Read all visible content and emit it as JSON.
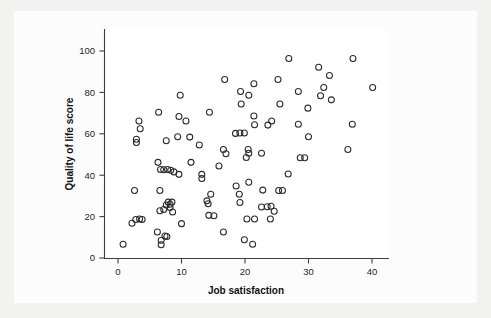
{
  "chart_data": {
    "type": "scatter",
    "title": "",
    "xlabel": "Job satisfaction",
    "ylabel": "Quality of life score",
    "xlim": [
      -1.5,
      42.5
    ],
    "ylim": [
      -4,
      107
    ],
    "xticks": [
      0,
      10,
      20,
      30,
      40
    ],
    "xtick_labels": [
      "0",
      "10",
      "20",
      "30",
      "40"
    ],
    "yticks": [
      0,
      20,
      40,
      60,
      80,
      100
    ],
    "ytick_labels": [
      "0",
      "20",
      "40",
      "60",
      "80",
      "100"
    ],
    "grid": false,
    "legend": null,
    "marker": "open-circle",
    "marker_color": "#2b2b2b",
    "marker_radius": 3.0,
    "n_points": 118,
    "points": [
      [
        0.8,
        6.6
      ],
      [
        2.2,
        16.8
      ],
      [
        2.8,
        18.6
      ],
      [
        3.4,
        18.8
      ],
      [
        3.8,
        18.6
      ],
      [
        2.6,
        32.6
      ],
      [
        2.9,
        57.4
      ],
      [
        2.9,
        55.8
      ],
      [
        3.3,
        66.2
      ],
      [
        3.5,
        62.4
      ],
      [
        6.2,
        12.6
      ],
      [
        6.8,
        8.6
      ],
      [
        6.8,
        6.4
      ],
      [
        7.4,
        10.6
      ],
      [
        7.7,
        10.4
      ],
      [
        6.6,
        22.8
      ],
      [
        7.2,
        23.4
      ],
      [
        7.6,
        25.6
      ],
      [
        7.9,
        27.0
      ],
      [
        8.2,
        26.0
      ],
      [
        8.5,
        27.0
      ],
      [
        8.2,
        24.4
      ],
      [
        8.6,
        22.2
      ],
      [
        6.6,
        32.6
      ],
      [
        6.3,
        46.2
      ],
      [
        6.7,
        42.8
      ],
      [
        7.2,
        42.6
      ],
      [
        7.8,
        42.8
      ],
      [
        8.3,
        42.4
      ],
      [
        8.8,
        41.6
      ],
      [
        9.6,
        40.4
      ],
      [
        6.4,
        70.4
      ],
      [
        7.6,
        56.6
      ],
      [
        9.4,
        58.6
      ],
      [
        9.6,
        68.4
      ],
      [
        9.8,
        78.6
      ],
      [
        10.0,
        16.6
      ],
      [
        10.7,
        66.2
      ],
      [
        11.3,
        58.4
      ],
      [
        11.5,
        46.2
      ],
      [
        12.8,
        54.6
      ],
      [
        13.2,
        40.4
      ],
      [
        13.2,
        38.4
      ],
      [
        14.0,
        27.6
      ],
      [
        14.2,
        26.2
      ],
      [
        14.6,
        30.8
      ],
      [
        14.3,
        20.6
      ],
      [
        15.1,
        20.4
      ],
      [
        14.4,
        70.4
      ],
      [
        15.9,
        44.4
      ],
      [
        16.6,
        12.6
      ],
      [
        16.8,
        86.2
      ],
      [
        16.6,
        52.4
      ],
      [
        17.0,
        50.4
      ],
      [
        18.5,
        60.2
      ],
      [
        19.2,
        60.4
      ],
      [
        19.9,
        60.4
      ],
      [
        18.6,
        34.8
      ],
      [
        19.1,
        30.8
      ],
      [
        19.2,
        26.8
      ],
      [
        19.4,
        74.4
      ],
      [
        19.3,
        80.4
      ],
      [
        20.2,
        48.6
      ],
      [
        20.5,
        52.4
      ],
      [
        20.6,
        50.6
      ],
      [
        20.6,
        78.6
      ],
      [
        20.3,
        18.8
      ],
      [
        19.9,
        8.8
      ],
      [
        20.6,
        36.6
      ],
      [
        21.2,
        6.6
      ],
      [
        21.5,
        18.8
      ],
      [
        21.4,
        84.2
      ],
      [
        21.4,
        68.6
      ],
      [
        21.5,
        64.4
      ],
      [
        22.6,
        50.6
      ],
      [
        22.8,
        32.8
      ],
      [
        22.6,
        24.6
      ],
      [
        23.5,
        24.8
      ],
      [
        23.6,
        64.2
      ],
      [
        24.2,
        66.2
      ],
      [
        24.0,
        18.8
      ],
      [
        24.1,
        25.0
      ],
      [
        24.6,
        22.6
      ],
      [
        25.3,
        32.6
      ],
      [
        25.9,
        32.6
      ],
      [
        25.2,
        86.2
      ],
      [
        25.5,
        74.4
      ],
      [
        26.8,
        40.6
      ],
      [
        26.9,
        96.4
      ],
      [
        28.4,
        80.4
      ],
      [
        28.4,
        64.6
      ],
      [
        28.7,
        48.4
      ],
      [
        29.4,
        48.4
      ],
      [
        30.0,
        58.6
      ],
      [
        29.9,
        72.4
      ],
      [
        31.6,
        92.2
      ],
      [
        31.9,
        78.4
      ],
      [
        32.4,
        82.4
      ],
      [
        33.3,
        88.2
      ],
      [
        33.6,
        76.4
      ],
      [
        36.2,
        52.4
      ],
      [
        36.9,
        64.6
      ],
      [
        37.0,
        96.4
      ],
      [
        40.1,
        82.4
      ]
    ]
  },
  "axes": {
    "x_title": "Job satisfaction",
    "y_title": "Quality of life score"
  }
}
